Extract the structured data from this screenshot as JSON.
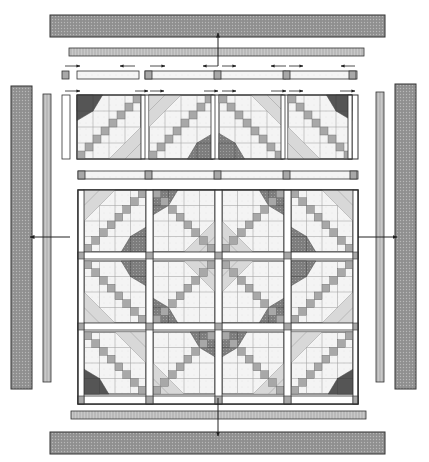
{
  "diagram": {
    "title": "",
    "type": "quilt-assembly-diagram",
    "width": 429,
    "height": 462,
    "colors": {
      "background": "#ffffff",
      "outline": "#333333",
      "outer_border": "#8c8c8c",
      "inner_border": "#b5b5b5",
      "sashing": "#ffffff",
      "cornerstone": "#a8a8a8",
      "small_square": "#a8a8a8",
      "light_triangle": "#d8d8d8",
      "very_light": "#eeeeee",
      "dark_triangle": "#555555",
      "medium_dotted": "#8a8a8a",
      "arrow": "#222222"
    },
    "outer_borders": [
      {
        "name": "top-outer-border",
        "x": 50,
        "y": 15,
        "w": 335,
        "h": 22
      },
      {
        "name": "bottom-outer-border",
        "x": 50,
        "y": 432,
        "w": 335,
        "h": 22
      },
      {
        "name": "left-outer-border",
        "x": 11,
        "y": 86,
        "w": 21,
        "h": 303
      },
      {
        "name": "right-outer-border",
        "x": 395,
        "y": 84,
        "w": 21,
        "h": 305
      }
    ],
    "inner_borders": [
      {
        "name": "top-inner-border",
        "x": 69,
        "y": 48,
        "w": 295,
        "h": 8
      },
      {
        "name": "bottom-inner-border",
        "x": 71,
        "y": 411,
        "w": 295,
        "h": 8
      },
      {
        "name": "left-inner-border",
        "x": 43,
        "y": 94,
        "w": 8,
        "h": 288
      },
      {
        "name": "right-inner-border",
        "x": 376,
        "y": 92,
        "w": 8,
        "h": 290
      }
    ],
    "top_row": {
      "sash_y": 71,
      "sash_h": 8,
      "block_y": 95,
      "block_size": 64,
      "corner_left": {
        "x": 62,
        "y": 71,
        "w": 7,
        "h": 8
      },
      "left_strip": {
        "x": 62,
        "y": 95,
        "w": 8,
        "h": 64
      },
      "sash_segments": [
        {
          "x": 77,
          "w": 62
        },
        {
          "x": 145,
          "w": 70
        },
        {
          "x": 215,
          "w": 70
        },
        {
          "x": 285,
          "w": 72
        }
      ],
      "cornerstones": [
        {
          "x": 145,
          "y": 71
        },
        {
          "x": 214,
          "y": 71
        },
        {
          "x": 283,
          "y": 71
        },
        {
          "x": 349,
          "y": 71
        }
      ],
      "blocks": [
        {
          "x": 77,
          "y": 95,
          "variant": "dark-top-left"
        },
        {
          "x": 149,
          "y": 95,
          "variant": "dotted-bottom-right"
        },
        {
          "x": 219,
          "y": 95,
          "variant": "dotted-bottom-left"
        },
        {
          "x": 288,
          "y": 95,
          "variant": "dark-top-right"
        }
      ],
      "vertical_sash_x": [
        145,
        215,
        285,
        352
      ],
      "arrows": [
        {
          "x1": 65,
          "x2": 80,
          "y": 66,
          "dir": "right"
        },
        {
          "x1": 135,
          "x2": 120,
          "y": 66,
          "dir": "left"
        },
        {
          "x1": 150,
          "x2": 165,
          "y": 66,
          "dir": "right"
        },
        {
          "x1": 218,
          "x2": 203,
          "y": 66,
          "dir": "left"
        },
        {
          "x1": 222,
          "x2": 236,
          "y": 66,
          "dir": "right"
        },
        {
          "x1": 286,
          "x2": 271,
          "y": 66,
          "dir": "left"
        },
        {
          "x1": 289,
          "x2": 303,
          "y": 66,
          "dir": "right"
        },
        {
          "x1": 355,
          "x2": 341,
          "y": 66,
          "dir": "left"
        },
        {
          "x1": 65,
          "x2": 80,
          "y": 91,
          "dir": "left"
        },
        {
          "x1": 135,
          "x2": 148,
          "y": 91,
          "dir": "right"
        },
        {
          "x1": 150,
          "x2": 164,
          "y": 91,
          "dir": "left"
        },
        {
          "x1": 204,
          "x2": 218,
          "y": 91,
          "dir": "right"
        },
        {
          "x1": 222,
          "x2": 236,
          "y": 91,
          "dir": "left"
        },
        {
          "x1": 271,
          "x2": 286,
          "y": 91,
          "dir": "right"
        },
        {
          "x1": 289,
          "x2": 303,
          "y": 91,
          "dir": "left"
        },
        {
          "x1": 340,
          "x2": 355,
          "y": 91,
          "dir": "right"
        }
      ]
    },
    "middle_sash": {
      "x": 78,
      "y": 171,
      "w": 280,
      "h": 8,
      "cornerstones_x": [
        78,
        145,
        214,
        283,
        350
      ]
    },
    "main_panel": {
      "x": 78,
      "y": 190,
      "w": 280,
      "h": 214,
      "blocks": [
        {
          "x": 84,
          "y": 190,
          "variant": "A"
        },
        {
          "x": 153,
          "y": 190,
          "variant": "B"
        },
        {
          "x": 222,
          "y": 190,
          "variant": "C"
        },
        {
          "x": 291,
          "y": 190,
          "variant": "D"
        },
        {
          "x": 84,
          "y": 261,
          "variant": "E"
        },
        {
          "x": 153,
          "y": 261,
          "variant": "F"
        },
        {
          "x": 222,
          "y": 261,
          "variant": "G"
        },
        {
          "x": 291,
          "y": 261,
          "variant": "H"
        },
        {
          "x": 84,
          "y": 332,
          "variant": "I"
        },
        {
          "x": 153,
          "y": 332,
          "variant": "J"
        },
        {
          "x": 222,
          "y": 332,
          "variant": "K"
        },
        {
          "x": 291,
          "y": 332,
          "variant": "L"
        }
      ],
      "block_size": 62,
      "grid_x": [
        78,
        84,
        146,
        153,
        215,
        222,
        284,
        291,
        353,
        358
      ],
      "grid_y": [
        190,
        252,
        259,
        323,
        330,
        396,
        404
      ]
    },
    "assembly_arrows": [
      {
        "name": "arrow-up-to-top-border",
        "x1": 218,
        "y1": 66,
        "x2": 218,
        "y2": 33
      },
      {
        "name": "arrow-down-to-bottom-border",
        "x1": 218,
        "y1": 398,
        "x2": 218,
        "y2": 436
      },
      {
        "name": "arrow-left-to-left-border",
        "x1": 70,
        "y1": 237,
        "x2": 30,
        "y2": 237
      },
      {
        "name": "arrow-right-to-right-border",
        "x1": 358,
        "y1": 237,
        "x2": 397,
        "y2": 237
      }
    ]
  }
}
